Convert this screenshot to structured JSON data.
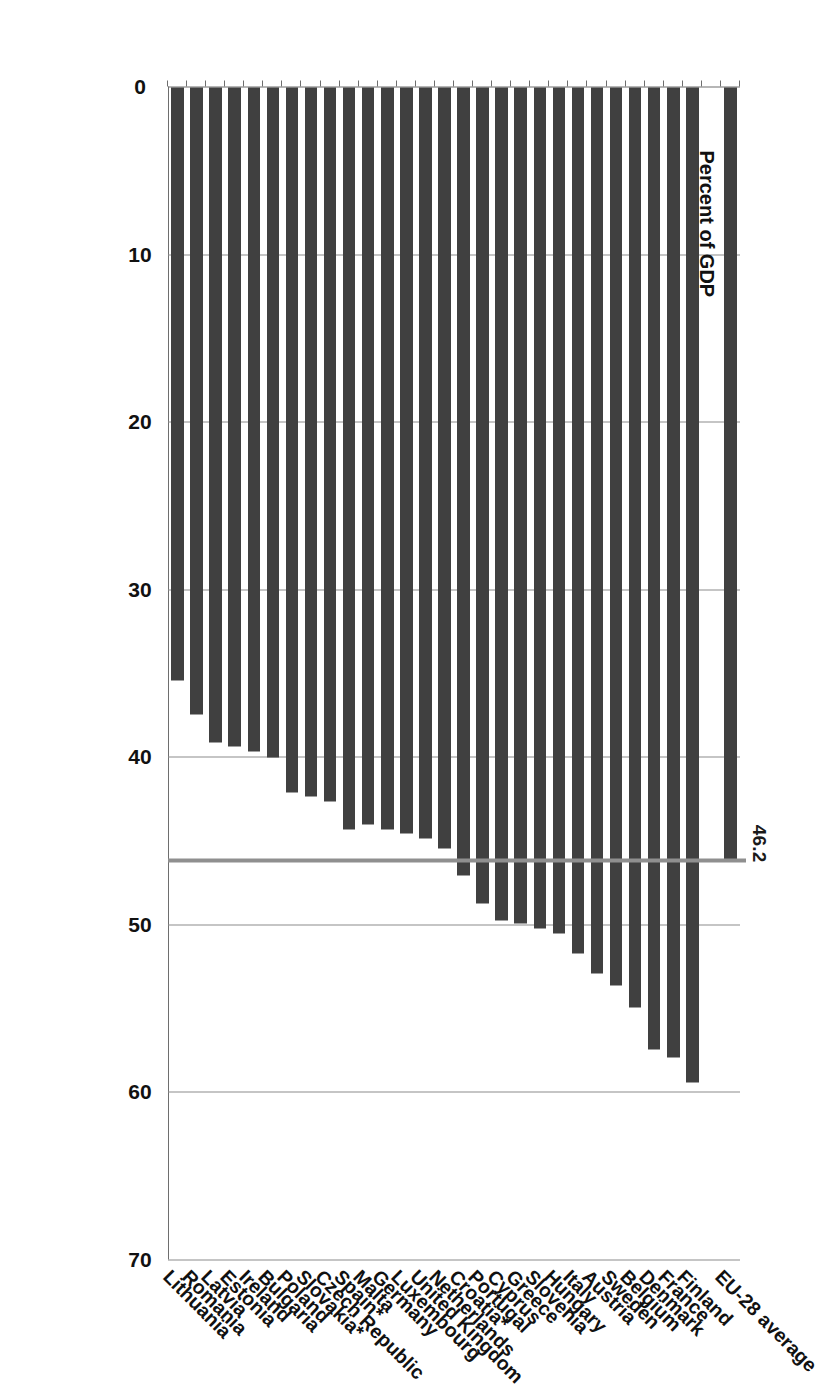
{
  "chart_data": {
    "type": "bar",
    "orientation": "horizontal",
    "title": "",
    "xlabel": "Percent of GDP",
    "ylabel": "",
    "xlim": [
      0,
      70
    ],
    "xticks": [
      0,
      10,
      20,
      30,
      40,
      50,
      60,
      70
    ],
    "grid": "vertical",
    "legend": "none",
    "bar_color": "#404040",
    "gridline_color": "#8c8c8c",
    "reference_line": {
      "label": "46.2",
      "value": 46.2,
      "color": "#8f8f8f",
      "description": "EU-28 average reference line"
    },
    "footnote_marker": "*",
    "categories": [
      "EU-28 average",
      "Finland",
      "France",
      "Denmark",
      "Belgium",
      "Sweden",
      "Austria",
      "Italy",
      "Hungary",
      "Slovenia",
      "Greece",
      "Cyprus",
      "Portugal",
      "Croatia*",
      "Netherlands",
      "United Kingdom",
      "Luxembourg",
      "Germany",
      "Malta",
      "Spain*",
      "Czech Republic",
      "Slovakia*",
      "Poland",
      "Bulgaria",
      "Ireland",
      "Estonia",
      "Latvia",
      "Romania",
      "Lithuania"
    ],
    "values": [
      46.2,
      59.4,
      57.9,
      57.4,
      54.9,
      53.6,
      52.9,
      51.7,
      50.5,
      50.2,
      49.9,
      49.7,
      48.7,
      47.0,
      45.4,
      44.8,
      44.5,
      44.3,
      44.0,
      44.3,
      42.6,
      42.3,
      42.1,
      40.0,
      39.6,
      39.3,
      39.1,
      37.4,
      35.4
    ],
    "gap_after_first_category": true
  }
}
